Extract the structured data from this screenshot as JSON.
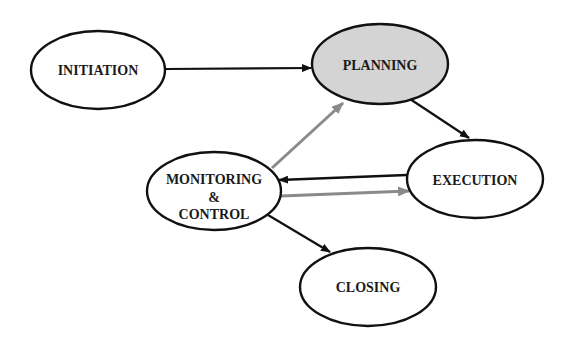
{
  "diagram": {
    "type": "process-flow",
    "colors": {
      "stroke": "#111111",
      "gray_arrow": "#8a8a8a",
      "highlight_fill": "#d4d4d4",
      "node_fill": "#ffffff"
    },
    "nodes": [
      {
        "id": "initiation",
        "label": "INITIATION",
        "highlighted": false
      },
      {
        "id": "planning",
        "label": "PLANNING",
        "highlighted": true
      },
      {
        "id": "execution",
        "label": "EXECUTION",
        "highlighted": false
      },
      {
        "id": "monitoring",
        "label_lines": [
          "MONITORING",
          "&",
          "CONTROL"
        ],
        "highlighted": false
      },
      {
        "id": "closing",
        "label": "CLOSING",
        "highlighted": false
      }
    ],
    "edges": [
      {
        "from": "initiation",
        "to": "planning",
        "color": "black"
      },
      {
        "from": "planning",
        "to": "execution",
        "color": "black"
      },
      {
        "from": "execution",
        "to": "monitoring",
        "color": "black"
      },
      {
        "from": "monitoring",
        "to": "execution",
        "color": "gray"
      },
      {
        "from": "monitoring",
        "to": "planning",
        "color": "gray"
      },
      {
        "from": "monitoring",
        "to": "closing",
        "color": "black"
      }
    ]
  }
}
